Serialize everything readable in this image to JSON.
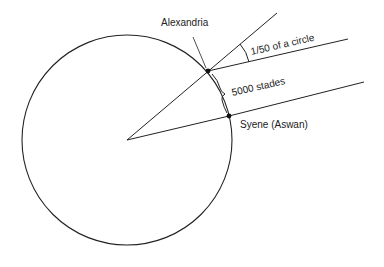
{
  "diagram": {
    "labels": {
      "alexandria": "Alexandria",
      "syene": "Syene (Aswan)",
      "angle": "1/50 of a circle",
      "distance": "5000 stades"
    },
    "geometry": {
      "center": [
        127,
        140
      ],
      "radius": 105,
      "alexandria_point": [
        208,
        71
      ],
      "syene_point": [
        229,
        116
      ]
    },
    "colors": {
      "stroke": "#222222",
      "background": "#ffffff"
    }
  }
}
